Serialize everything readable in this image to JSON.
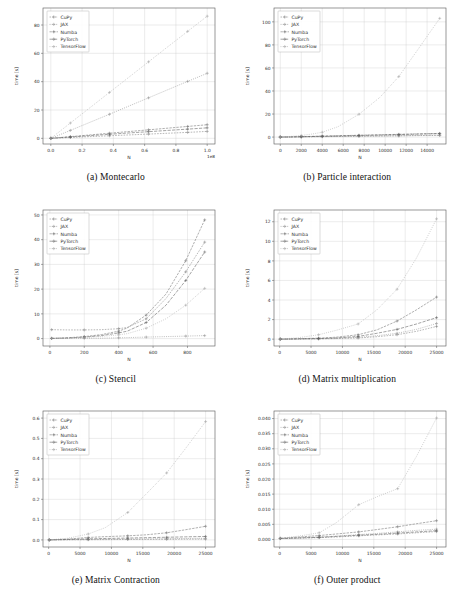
{
  "figure": {
    "panels": [
      {
        "caption": "(a) Montecarlo",
        "key": "montecarlo"
      },
      {
        "caption": "(b) Particle interaction",
        "key": "particle"
      },
      {
        "caption": "(c) Stencil",
        "key": "stencil"
      },
      {
        "caption": "(d) Matrix multiplication",
        "key": "matmul"
      },
      {
        "caption": "(e) Matrix Contraction",
        "key": "contraction"
      },
      {
        "caption": "(f) Outer product",
        "key": "outer"
      }
    ],
    "legend_entries": [
      "CuPy",
      "JAX",
      "Numba",
      "PyTorch",
      "TensorFlow"
    ],
    "series_colors": [
      "#7d7d7d",
      "#8f8f8f",
      "#6e6e6e",
      "#5a5a5a",
      "#a0a0a0"
    ],
    "grid_color": "#c9c9c9",
    "axis_color": "#555555"
  },
  "chart_data": [
    {
      "type": "line",
      "id": "montecarlo",
      "title": "(a) Montecarlo",
      "xlabel": "N",
      "ylabel": "time [s]",
      "x_offset_text": "1e8",
      "xlim": [
        -0.05,
        1.05
      ],
      "ylim": [
        -4,
        92
      ],
      "xticks": [
        0.0,
        0.2,
        0.4,
        0.6,
        0.8,
        1.0
      ],
      "xticklabels": [
        "0.0",
        "0.2",
        "0.4",
        "0.6",
        "0.8",
        "1.0"
      ],
      "yticks": [
        0,
        20,
        40,
        60,
        80
      ],
      "yticklabels": [
        "0",
        "20",
        "40",
        "60",
        "80"
      ],
      "grid": true,
      "legend_position": "upper left",
      "x": [
        0.0,
        0.05,
        0.125,
        0.25,
        0.375,
        0.5,
        0.625,
        0.75,
        0.875,
        1.0
      ],
      "series": [
        {
          "name": "CuPy",
          "values": [
            0.0,
            0.25,
            0.6,
            1.2,
            1.8,
            2.4,
            3.0,
            3.6,
            4.2,
            4.9
          ]
        },
        {
          "name": "JAX",
          "values": [
            0.0,
            2.2,
            5.6,
            11.3,
            17.0,
            22.8,
            28.6,
            34.4,
            40.2,
            45.9
          ]
        },
        {
          "name": "Numba",
          "values": [
            0.0,
            0.5,
            1.2,
            2.4,
            3.6,
            4.8,
            6.0,
            7.2,
            8.4,
            9.6
          ]
        },
        {
          "name": "PyTorch",
          "values": [
            0.0,
            0.4,
            0.95,
            1.9,
            2.85,
            3.8,
            4.7,
            5.6,
            6.5,
            7.4
          ]
        },
        {
          "name": "TensorFlow",
          "values": [
            0.0,
            4.3,
            10.8,
            21.6,
            32.4,
            43.2,
            54.0,
            64.8,
            75.5,
            86.2
          ]
        }
      ]
    },
    {
      "type": "line",
      "id": "particle",
      "title": "(b) Particle interaction",
      "xlabel": "N",
      "ylabel": "time [s]",
      "x_offset_text": "",
      "xlim": [
        -600,
        15800
      ],
      "ylim": [
        -6,
        112
      ],
      "xticks": [
        0,
        2000,
        4000,
        6000,
        8000,
        10000,
        12000,
        14000
      ],
      "xticklabels": [
        "0",
        "2000",
        "4000",
        "6000",
        "8000",
        "10000",
        "12000",
        "14000"
      ],
      "yticks": [
        0,
        20,
        40,
        60,
        80,
        100
      ],
      "yticklabels": [
        "0",
        "20",
        "40",
        "60",
        "80",
        "100"
      ],
      "grid": true,
      "legend_position": "upper left",
      "x": [
        0,
        1000,
        2000,
        3000,
        4000,
        5500,
        7500,
        9500,
        11300,
        13200,
        15200
      ],
      "series": [
        {
          "name": "CuPy",
          "values": [
            0.0,
            0.1,
            0.2,
            0.3,
            0.4,
            0.5,
            0.7,
            0.9,
            1.1,
            1.3,
            1.5
          ]
        },
        {
          "name": "JAX",
          "values": [
            0.0,
            0.1,
            0.2,
            0.3,
            0.4,
            0.6,
            0.8,
            1.0,
            1.2,
            1.4,
            1.6
          ]
        },
        {
          "name": "Numba",
          "values": [
            0.0,
            0.2,
            0.4,
            0.6,
            0.9,
            1.2,
            1.6,
            2.0,
            2.4,
            2.8,
            3.2
          ]
        },
        {
          "name": "PyTorch",
          "values": [
            0.0,
            0.1,
            0.3,
            0.5,
            0.7,
            1.0,
            1.4,
            1.8,
            2.2,
            2.6,
            3.0
          ]
        },
        {
          "name": "TensorFlow",
          "values": [
            0.0,
            0.6,
            1.4,
            2.6,
            4.2,
            9.0,
            19.8,
            34.5,
            52.5,
            77.0,
            103.0
          ]
        }
      ]
    },
    {
      "type": "line",
      "id": "stencil",
      "title": "(c) Stencil",
      "xlabel": "N",
      "ylabel": "time [s]",
      "x_offset_text": "",
      "xlim": [
        -40,
        960
      ],
      "ylim": [
        -3,
        52
      ],
      "xticks": [
        0,
        200,
        400,
        600,
        800
      ],
      "xticklabels": [
        "0",
        "200",
        "400",
        "600",
        "800"
      ],
      "yticks": [
        0,
        10,
        20,
        30,
        40,
        50
      ],
      "yticklabels": [
        "0",
        "10",
        "20",
        "30",
        "40",
        "50"
      ],
      "grid": true,
      "legend_position": "upper left",
      "x": [
        10,
        100,
        200,
        300,
        400,
        450,
        560,
        675,
        790,
        900
      ],
      "series": [
        {
          "name": "CuPy",
          "values": [
            3.6,
            3.5,
            3.5,
            3.6,
            4.0,
            4.5,
            8.0,
            16.2,
            27.0,
            39.0
          ]
        },
        {
          "name": "JAX",
          "values": [
            0.05,
            0.08,
            0.1,
            0.15,
            0.3,
            0.4,
            0.6,
            0.8,
            1.0,
            1.2
          ]
        },
        {
          "name": "Numba",
          "values": [
            0.1,
            0.3,
            0.8,
            1.6,
            3.0,
            4.3,
            9.5,
            18.0,
            31.5,
            48.0
          ]
        },
        {
          "name": "PyTorch",
          "values": [
            0.08,
            0.25,
            0.6,
            1.2,
            2.3,
            3.0,
            6.5,
            13.5,
            23.5,
            35.0
          ]
        },
        {
          "name": "TensorFlow",
          "values": [
            0.05,
            0.2,
            0.5,
            0.9,
            1.5,
            2.0,
            4.2,
            8.0,
            13.5,
            20.3
          ]
        }
      ]
    },
    {
      "type": "line",
      "id": "matmul",
      "title": "(d) Matrix multiplication",
      "xlabel": "N",
      "ylabel": "time [s]",
      "x_offset_text": "",
      "xlim": [
        -900,
        26500
      ],
      "ylim": [
        -0.7,
        13.2
      ],
      "xticks": [
        0,
        5000,
        10000,
        15000,
        20000,
        25000
      ],
      "xticklabels": [
        "0",
        "5000",
        "10000",
        "15000",
        "20000",
        "25000"
      ],
      "yticks": [
        0,
        2,
        4,
        6,
        8,
        10,
        12
      ],
      "yticklabels": [
        "0",
        "2",
        "4",
        "6",
        "8",
        "10",
        "12"
      ],
      "grid": true,
      "legend_position": "upper left",
      "x": [
        100,
        3000,
        6200,
        9000,
        12500,
        15500,
        18700,
        21800,
        25000
      ],
      "series": [
        {
          "name": "CuPy",
          "values": [
            0.0,
            0.01,
            0.03,
            0.06,
            0.12,
            0.25,
            0.45,
            0.8,
            1.3
          ]
        },
        {
          "name": "JAX",
          "values": [
            0.0,
            0.02,
            0.05,
            0.09,
            0.18,
            0.35,
            0.6,
            1.0,
            1.6
          ]
        },
        {
          "name": "Numba",
          "values": [
            0.0,
            0.05,
            0.1,
            0.2,
            0.45,
            0.95,
            1.85,
            3.0,
            4.3
          ]
        },
        {
          "name": "PyTorch",
          "values": [
            0.0,
            0.03,
            0.06,
            0.12,
            0.28,
            0.6,
            1.0,
            1.55,
            2.2
          ]
        },
        {
          "name": "TensorFlow",
          "values": [
            0.0,
            0.15,
            0.45,
            0.9,
            1.55,
            3.0,
            5.1,
            8.3,
            12.3
          ]
        }
      ]
    },
    {
      "type": "line",
      "id": "contraction",
      "title": "(e) Matrix Contraction",
      "xlabel": "N",
      "ylabel": "time [s]",
      "x_offset_text": "",
      "xlim": [
        -900,
        26500
      ],
      "ylim": [
        -0.035,
        0.635
      ],
      "xticks": [
        0,
        5000,
        10000,
        15000,
        20000,
        25000
      ],
      "xticklabels": [
        "0",
        "5000",
        "10000",
        "15000",
        "20000",
        "25000"
      ],
      "yticks": [
        0.0,
        0.1,
        0.2,
        0.3,
        0.4,
        0.5,
        0.6
      ],
      "yticklabels": [
        "0.0",
        "0.1",
        "0.2",
        "0.3",
        "0.4",
        "0.5",
        "0.6"
      ],
      "grid": true,
      "legend_position": "upper left",
      "x": [
        100,
        3000,
        6300,
        9000,
        12600,
        15500,
        18800,
        21800,
        25000
      ],
      "series": [
        {
          "name": "CuPy",
          "values": [
            0.0,
            0.0005,
            0.001,
            0.0015,
            0.002,
            0.0025,
            0.003,
            0.0035,
            0.004
          ]
        },
        {
          "name": "JAX",
          "values": [
            0.0,
            0.001,
            0.002,
            0.003,
            0.004,
            0.005,
            0.006,
            0.007,
            0.008
          ]
        },
        {
          "name": "Numba",
          "values": [
            0.0,
            0.004,
            0.012,
            0.016,
            0.02,
            0.025,
            0.035,
            0.05,
            0.067
          ]
        },
        {
          "name": "PyTorch",
          "values": [
            0.0,
            0.002,
            0.005,
            0.007,
            0.009,
            0.011,
            0.013,
            0.015,
            0.017
          ]
        },
        {
          "name": "TensorFlow",
          "values": [
            0.0,
            0.008,
            0.029,
            0.06,
            0.135,
            0.225,
            0.33,
            0.45,
            0.583
          ]
        }
      ]
    },
    {
      "type": "line",
      "id": "outer",
      "title": "(f) Outer product",
      "xlabel": "N",
      "ylabel": "time [s]",
      "x_offset_text": "",
      "xlim": [
        -900,
        26500
      ],
      "ylim": [
        -0.0025,
        0.0425
      ],
      "xticks": [
        0,
        5000,
        10000,
        15000,
        20000,
        25000
      ],
      "xticklabels": [
        "0",
        "5000",
        "10000",
        "15000",
        "20000",
        "25000"
      ],
      "yticks": [
        0.0,
        0.005,
        0.01,
        0.015,
        0.02,
        0.025,
        0.03,
        0.035,
        0.04
      ],
      "yticklabels": [
        "0.000",
        "0.005",
        "0.010",
        "0.015",
        "0.020",
        "0.025",
        "0.030",
        "0.035",
        "0.040"
      ],
      "grid": true,
      "legend_position": "upper left",
      "x": [
        100,
        3000,
        6300,
        9000,
        12600,
        15600,
        18800,
        21800,
        25000
      ],
      "series": [
        {
          "name": "CuPy",
          "values": [
            0.0003,
            0.0004,
            0.0006,
            0.0008,
            0.0012,
            0.0015,
            0.0018,
            0.0022,
            0.0026
          ]
        },
        {
          "name": "JAX",
          "values": [
            0.0003,
            0.0005,
            0.0008,
            0.0011,
            0.0016,
            0.002,
            0.0025,
            0.003,
            0.0034
          ]
        },
        {
          "name": "Numba",
          "values": [
            0.0004,
            0.0008,
            0.0013,
            0.0018,
            0.0025,
            0.0033,
            0.0042,
            0.0052,
            0.0062
          ]
        },
        {
          "name": "PyTorch",
          "values": [
            0.0003,
            0.0005,
            0.0007,
            0.001,
            0.0014,
            0.0017,
            0.0021,
            0.0025,
            0.0029
          ]
        },
        {
          "name": "TensorFlow",
          "values": [
            0.0004,
            0.0011,
            0.0022,
            0.0055,
            0.0115,
            0.0142,
            0.0168,
            0.0275,
            0.0402
          ]
        }
      ]
    }
  ]
}
